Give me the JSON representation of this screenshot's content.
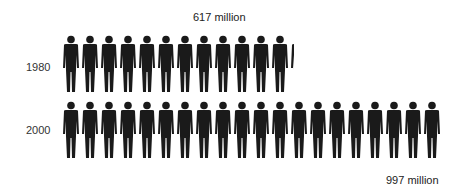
{
  "chart_data": {
    "type": "pictogram",
    "title": "",
    "unit_per_icon": "50 million",
    "icon": "person-icon",
    "icon_color": "#1a1a1a",
    "categories": [
      "1980",
      "2000"
    ],
    "values": [
      617,
      997
    ],
    "value_labels": [
      "617 million",
      "997 million"
    ],
    "icons_full": [
      12,
      20
    ],
    "icons_fraction": [
      0.34,
      0.0
    ]
  },
  "rows": [
    {
      "year": "1980",
      "label": "617 million",
      "full": 12,
      "partial_width": 4
    },
    {
      "year": "2000",
      "label": "997 million",
      "full": 20,
      "partial_width": 0
    }
  ]
}
